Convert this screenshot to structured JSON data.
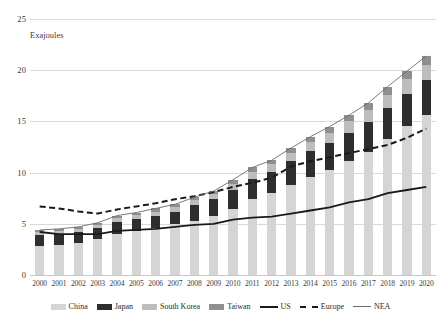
{
  "chart_data": {
    "type": "bar",
    "title": "",
    "subtitle": "",
    "xlabel": "",
    "ylabel": "Exajoules",
    "ylim": [
      0,
      25
    ],
    "yticks": [
      0,
      5,
      10,
      15,
      20,
      25
    ],
    "grid": true,
    "stacked": true,
    "legend_position": "bottom",
    "categories": [
      "2000",
      "2001",
      "2002",
      "2003",
      "2004",
      "2005",
      "2006",
      "2007",
      "2008",
      "2009",
      "2010",
      "2011",
      "2012",
      "2013",
      "2014",
      "2015",
      "2016",
      "2017",
      "2018",
      "2019",
      "2020"
    ],
    "series": [
      {
        "name": "China",
        "kind": "bar",
        "color": "#d5d5d5",
        "values": [
          2.8,
          2.9,
          3.1,
          3.5,
          4.0,
          4.3,
          4.6,
          5.0,
          5.3,
          5.8,
          6.4,
          7.4,
          8.0,
          8.8,
          9.6,
          10.3,
          11.1,
          12.0,
          13.3,
          14.6,
          15.6
        ]
      },
      {
        "name": "Japan",
        "kind": "bar",
        "color": "#2e2e2e",
        "values": [
          1.1,
          1.1,
          1.1,
          1.1,
          1.2,
          1.2,
          1.2,
          1.2,
          1.5,
          1.6,
          1.9,
          2.0,
          2.1,
          2.3,
          2.5,
          2.6,
          2.8,
          2.9,
          3.0,
          3.1,
          3.4
        ]
      },
      {
        "name": "South Korea",
        "kind": "bar",
        "color": "#bdbdbd",
        "values": [
          0.3,
          0.3,
          0.3,
          0.3,
          0.4,
          0.4,
          0.4,
          0.4,
          0.5,
          0.5,
          0.6,
          0.7,
          0.7,
          0.8,
          0.9,
          1.0,
          1.1,
          1.2,
          1.3,
          1.4,
          1.5
        ]
      },
      {
        "name": "Taiwan",
        "kind": "bar",
        "color": "#8f8f8f",
        "values": [
          0.2,
          0.2,
          0.2,
          0.2,
          0.2,
          0.2,
          0.3,
          0.3,
          0.3,
          0.3,
          0.4,
          0.4,
          0.4,
          0.5,
          0.5,
          0.6,
          0.6,
          0.7,
          0.8,
          0.8,
          0.9
        ]
      },
      {
        "name": "US",
        "kind": "line",
        "style": "solid",
        "color": "#1a1a1a",
        "width": 1.8,
        "values": [
          4.2,
          4.0,
          4.0,
          4.0,
          4.3,
          4.4,
          4.5,
          4.7,
          4.9,
          5.0,
          5.4,
          5.6,
          5.7,
          6.0,
          6.3,
          6.6,
          7.1,
          7.4,
          8.0,
          8.3,
          8.6
        ]
      },
      {
        "name": "Europe",
        "kind": "line",
        "style": "dashed",
        "color": "#1a1a1a",
        "width": 2,
        "values": [
          6.7,
          6.5,
          6.2,
          6.0,
          6.4,
          6.7,
          7.0,
          7.4,
          7.7,
          8.1,
          8.6,
          9.0,
          9.5,
          10.6,
          11.1,
          11.5,
          11.9,
          12.3,
          12.7,
          13.4,
          14.3
        ]
      },
      {
        "name": "NEA",
        "kind": "line",
        "style": "solid",
        "color": "#6b6b6b",
        "width": 0.9,
        "values": [
          4.4,
          4.5,
          4.7,
          5.1,
          5.8,
          6.1,
          6.5,
          6.9,
          7.6,
          8.2,
          9.3,
          10.5,
          11.2,
          12.4,
          13.5,
          14.5,
          15.6,
          16.8,
          18.4,
          19.9,
          21.4
        ]
      }
    ],
    "legend_entries": [
      {
        "label": "China",
        "type": "swatch",
        "color": "#d5d5d5"
      },
      {
        "label": "Japan",
        "type": "swatch",
        "color": "#2e2e2e"
      },
      {
        "label": "South Korea",
        "type": "swatch",
        "color": "#bdbdbd"
      },
      {
        "label": "Taiwan",
        "type": "swatch",
        "color": "#8f8f8f"
      },
      {
        "label": "US",
        "type": "line-solid-thick",
        "color": "#1a1a1a"
      },
      {
        "label": "Europe",
        "type": "line-dashed",
        "color": "#1a1a1a"
      },
      {
        "label": "NEA",
        "type": "line-solid-thin",
        "color": "#6b6b6b"
      }
    ]
  },
  "axes": {
    "y_unit_label": "Exajoules",
    "y_tick_labels": [
      "0",
      "5",
      "10",
      "15",
      "20",
      "25"
    ],
    "x_tick_labels": [
      "2000",
      "2001",
      "2002",
      "2003",
      "2004",
      "2005",
      "2006",
      "2007",
      "2008",
      "2009",
      "2010",
      "2011",
      "2012",
      "2013",
      "2014",
      "2015",
      "2016",
      "2017",
      "2018",
      "2019",
      "2020"
    ]
  }
}
